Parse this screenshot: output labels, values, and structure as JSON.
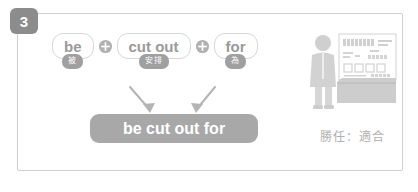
{
  "step": {
    "number": "3"
  },
  "formula": {
    "terms": [
      {
        "word": "be",
        "gloss": "被"
      },
      {
        "word": "cut out",
        "gloss": "安排"
      },
      {
        "word": "for",
        "gloss": "為"
      }
    ],
    "operator_icon": "plus-circle-icon",
    "operators": [
      "+",
      "+"
    ]
  },
  "result": {
    "phrase": "be cut out for"
  },
  "illustration": {
    "name": "shopkeeper-behind-counter-illustration",
    "caption": "勝任：適合"
  },
  "colors": {
    "badge_dark": "#8c8c8c",
    "badge_gray": "#a0a0a0",
    "pill_gray": "#a8a8a8",
    "text_gray": "#9a9a9a",
    "border_gray": "#d8d8d8",
    "frame_gray": "#cfcfcf",
    "illustration_gray": "#d2d2d2"
  }
}
